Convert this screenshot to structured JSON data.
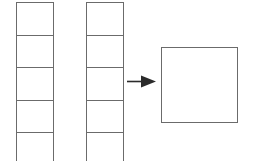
{
  "diagram": {
    "type": "schematic",
    "background_color": "#ffffff",
    "stroke_color": "#6b6b6b",
    "stroke_width_px": 1.5,
    "canvas": {
      "width": 257,
      "height": 161
    },
    "columns": [
      {
        "name": "column-left",
        "x": 16,
        "y": 2,
        "width": 38,
        "cell_height": 32.5,
        "visible_cell_count": 5,
        "clipped_at_bottom": true,
        "fill": "#ffffff",
        "cells": [
          {
            "label": ""
          },
          {
            "label": ""
          },
          {
            "label": ""
          },
          {
            "label": ""
          },
          {
            "label": ""
          }
        ]
      },
      {
        "name": "column-right",
        "x": 86,
        "y": 2,
        "width": 38,
        "cell_height": 32.5,
        "visible_cell_count": 5,
        "clipped_at_bottom": true,
        "fill": "#ffffff",
        "cells": [
          {
            "label": ""
          },
          {
            "label": ""
          },
          {
            "label": ""
          },
          {
            "label": ""
          },
          {
            "label": ""
          }
        ]
      }
    ],
    "arrow": {
      "name": "arrow-right",
      "direction": "right",
      "x": 127,
      "y": 75,
      "width": 29,
      "height": 13,
      "color": "#2b2b2b",
      "label": ""
    },
    "result_shape": {
      "name": "result-square",
      "shape": "square",
      "x": 161,
      "y": 47,
      "width": 77,
      "height": 76,
      "fill": "#ffffff",
      "stroke": "#6b6b6b",
      "label": ""
    }
  }
}
